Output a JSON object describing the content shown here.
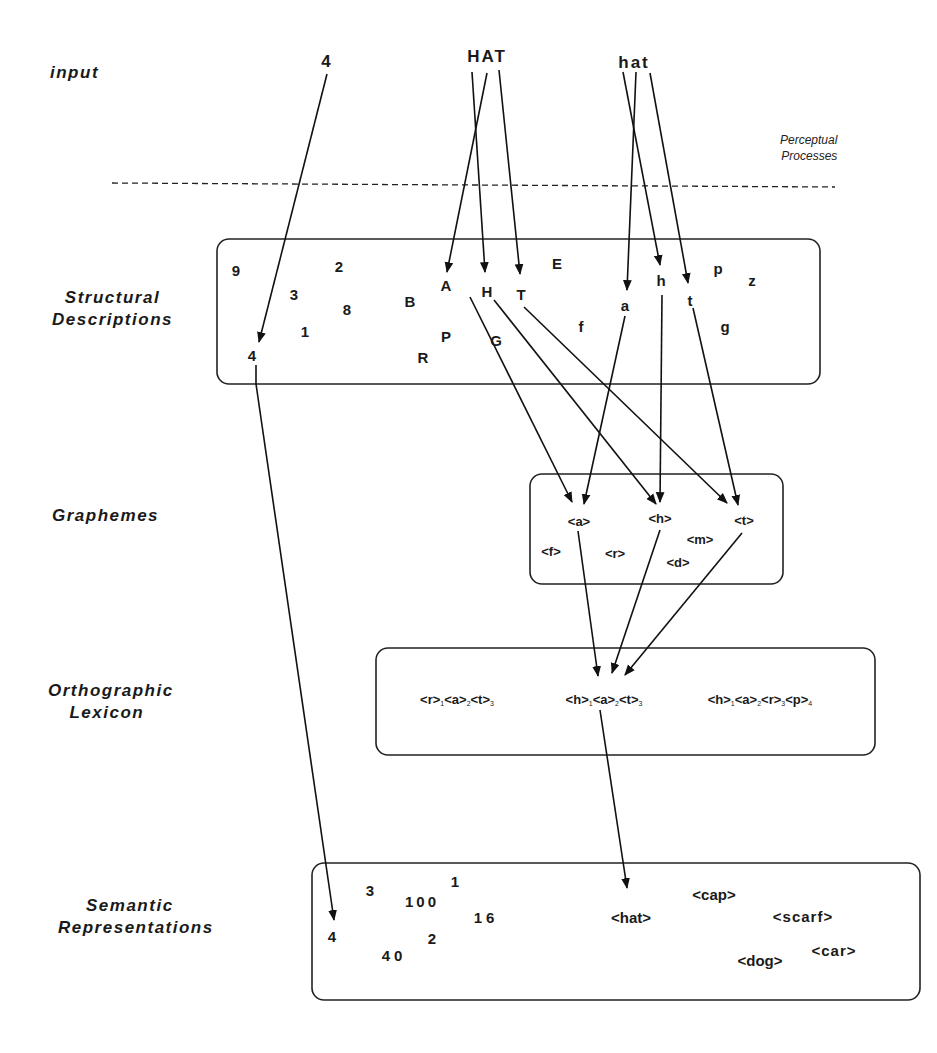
{
  "levels": {
    "input": "input",
    "structural_1": "Structural",
    "structural_2": "Descriptions",
    "graphemes": "Graphemes",
    "ortho_1": "Orthographic",
    "ortho_2": "Lexicon",
    "semantic_1": "Semantic",
    "semantic_2": "Representations"
  },
  "note": {
    "line1": "Perceptual",
    "line2": "Processes"
  },
  "inputs": [
    "4",
    "HAT",
    "hat"
  ],
  "structural": [
    "9",
    "2",
    "3",
    "8",
    "1",
    "4",
    "B",
    "A",
    "H",
    "T",
    "E",
    "P",
    "R",
    "G",
    "f",
    "a",
    "h",
    "t",
    "p",
    "z",
    "g"
  ],
  "graphemes": [
    "<a>",
    "<h>",
    "<t>",
    "<m>",
    "<f>",
    "<r>",
    "<d>"
  ],
  "ortho": {
    "w1": [
      [
        "<r>",
        "1"
      ],
      [
        "<a>",
        "2"
      ],
      [
        "<t>",
        "3"
      ]
    ],
    "w2": [
      [
        "<h>",
        "1"
      ],
      [
        "<a>",
        "2"
      ],
      [
        "<t>",
        "3"
      ]
    ],
    "w3": [
      [
        "<h>",
        "1"
      ],
      [
        "<a>",
        "2"
      ],
      [
        "<r>",
        "3"
      ],
      [
        "<p>",
        "4"
      ]
    ]
  },
  "semantic": [
    "3",
    "100",
    "1",
    "16",
    "4",
    "2",
    "40",
    "<hat>",
    "<cap>",
    "<scarf>",
    "<dog>",
    "<car>"
  ]
}
